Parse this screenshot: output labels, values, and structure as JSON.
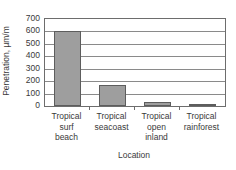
{
  "chart_data": {
    "type": "bar",
    "title": "",
    "subtitle": "",
    "xlabel": "Location",
    "ylabel": "Penetration, µm/m",
    "categories": [
      "Tropical surf beach",
      "Tropical seacoast",
      "Tropical open inland",
      "Tropical rainforest"
    ],
    "category_lines": [
      [
        "Tropical",
        "surf",
        "beach"
      ],
      [
        "Tropical",
        "seacoast"
      ],
      [
        "Tropical",
        "open",
        "inland"
      ],
      [
        "Tropical",
        "rainforest"
      ]
    ],
    "values": [
      600,
      170,
      35,
      20
    ],
    "ylim": [
      0,
      700
    ],
    "ytick_step": 100,
    "yticks": [
      700,
      600,
      500,
      400,
      300,
      200,
      100,
      0
    ],
    "ytick_labels": [
      "700",
      "600",
      "500",
      "400",
      "300",
      "200",
      "100",
      "0"
    ],
    "grid": "horizontal",
    "legend": "none",
    "bar_color": "#9e9e9e",
    "bar_edge_color": "#5d5d5d",
    "axis_color": "#6d6d6d",
    "gridline_color": "#8a8a8a",
    "text_color": "#3a3a3a",
    "background_color": "#ffffff",
    "annotations": []
  }
}
